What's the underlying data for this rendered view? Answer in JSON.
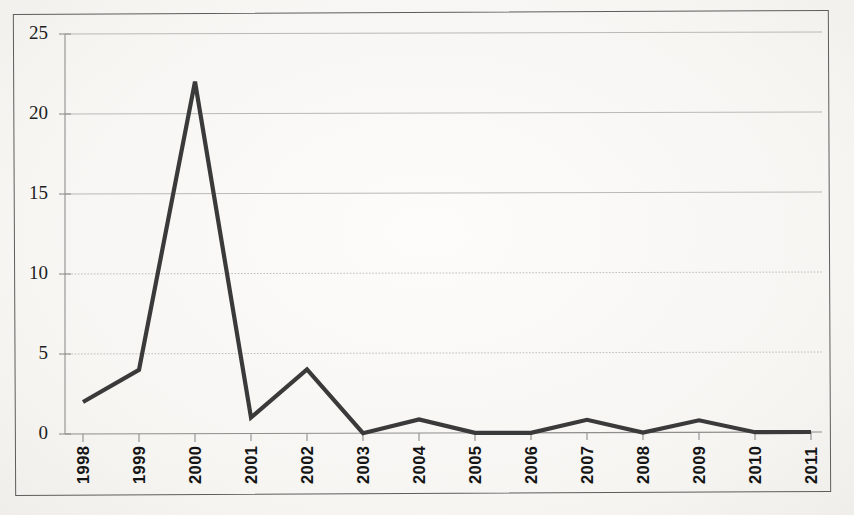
{
  "chart_data": {
    "type": "line",
    "title": "",
    "subtitle": "",
    "xlabel": "",
    "ylabel": "",
    "categories": [
      "1998",
      "1999",
      "2000",
      "2001",
      "2002",
      "2003",
      "2004",
      "2005",
      "2006",
      "2007",
      "2008",
      "2009",
      "2010",
      "2011"
    ],
    "series": [
      {
        "name": "",
        "values": [
          2,
          4,
          22,
          1,
          4,
          0,
          0.85,
          0,
          0,
          0.8,
          0,
          0.75,
          0,
          0
        ]
      }
    ],
    "ylim": [
      0,
      25
    ],
    "yticks": [
      0,
      5,
      10,
      15,
      20,
      25
    ],
    "ytick_labels": [
      "0",
      "5",
      "10",
      "15",
      "20",
      "25"
    ],
    "xtick_labels": [
      "1998",
      "1999",
      "2000",
      "2001",
      "2002",
      "2003",
      "2004",
      "2005",
      "2006",
      "2007",
      "2008",
      "2009",
      "2010",
      "2011"
    ],
    "xtick_rotation": 90,
    "grid": true,
    "grid_axis": "y",
    "legend": false,
    "legend_position": "none",
    "markers": false,
    "line_color": "#3a3a3a",
    "grid_color": "#b9b9b6",
    "axis_color": "#8e8e8b",
    "background_color": "#fbfaf8",
    "border_color": "#5d5d5b"
  },
  "axes": {
    "y_labels": [
      "25",
      "20",
      "15",
      "10",
      "5",
      "0"
    ],
    "x_labels": [
      "1998",
      "1999",
      "2000",
      "2001",
      "2002",
      "2003",
      "2004",
      "2005",
      "2006",
      "2007",
      "2008",
      "2009",
      "2010",
      "2011"
    ]
  }
}
